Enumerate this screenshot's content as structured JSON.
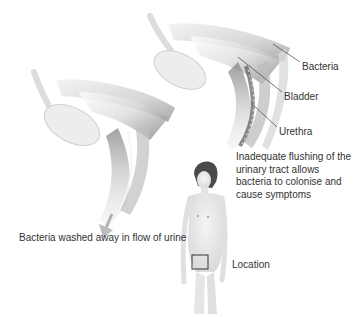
{
  "labels": {
    "bacteria": "Bacteria",
    "bladder": "Bladder",
    "urethra": "Urethra",
    "location": "Location"
  },
  "captions": {
    "inadequate_flushing": "Inadequate flushing of the\nurinary tract allows\nbacteria to colonise and\ncause symptoms",
    "washed_away": "Bacteria washed away in flow of urine"
  },
  "panels": [
    {
      "name": "healthy-flow",
      "description": "Cross-section of bladder and urethra with downward arrow showing urine flow"
    },
    {
      "name": "infection",
      "description": "Cross-section of bladder and urethra with bacteria colonising the urethra"
    }
  ],
  "colors": {
    "text": "#333333",
    "tissue_light": "#e6e6e6",
    "tissue_mid": "#bdbdbd",
    "tissue_dark": "#6e6e6e",
    "leader_line": "#555555",
    "location_box": "#333333"
  }
}
